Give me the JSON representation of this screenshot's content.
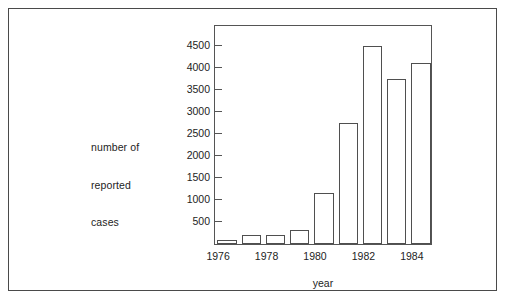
{
  "figure": {
    "caption_partial": "Figure 1.1 Reported cases ...",
    "frame_color": "#4a4a4a"
  },
  "chart_data": {
    "type": "bar",
    "title": "",
    "xlabel": "year",
    "ylabel": "number of\nreported\ncases",
    "ylabel_lines": [
      "number of",
      "reported",
      "cases"
    ],
    "categories": [
      "1976",
      "1977",
      "1978",
      "1979",
      "1980",
      "1981",
      "1982",
      "1983",
      "1984"
    ],
    "values": [
      100,
      200,
      200,
      320,
      1150,
      2750,
      4500,
      3750,
      4120
    ],
    "xtick_labels": [
      "1976",
      "1978",
      "1980",
      "1982",
      "1984"
    ],
    "xtick_categories": [
      "1976",
      "1978",
      "1980",
      "1982",
      "1984"
    ],
    "ytick_labels": [
      "500",
      "1000",
      "1500",
      "2000",
      "2500",
      "3000",
      "3500",
      "4000",
      "4500"
    ],
    "ytick_values": [
      500,
      1000,
      1500,
      2000,
      2500,
      3000,
      3500,
      4000,
      4500
    ],
    "ylim": [
      0,
      5000
    ],
    "grid": false,
    "legend": null,
    "bar_fill": "#ffffff",
    "bar_edge": "#4f4f4f"
  }
}
